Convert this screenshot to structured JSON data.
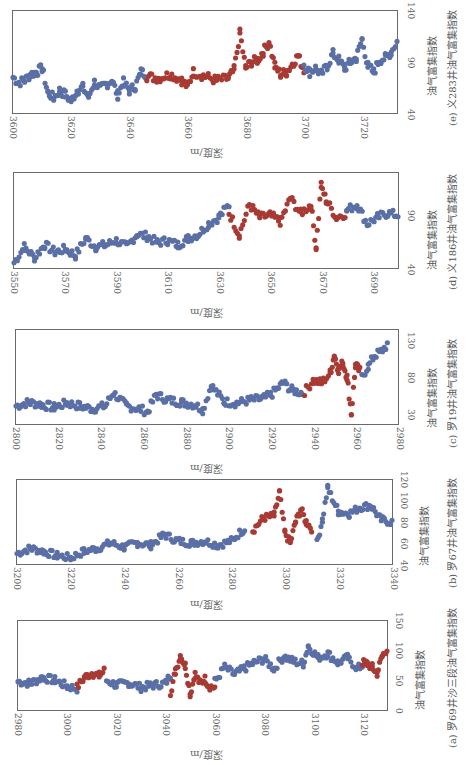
{
  "colors": {
    "normal": "#5a6fa6",
    "enriched": "#a83a33",
    "frame": "#6a6a6a"
  },
  "chart_data": [
    {
      "id": "e",
      "type": "scatter",
      "title": "(e) 义283井油气富集指数",
      "xlabel": "深度/m",
      "ylabel": "油气富集指数",
      "xlim": [
        3600,
        3732
      ],
      "ylim": [
        40,
        140
      ],
      "xticks": [
        "3600",
        "3620",
        "3640",
        "3660",
        "3680",
        "3700",
        "3720"
      ],
      "yticks": [
        "40",
        "90",
        "140"
      ],
      "enriched_interval": [
        3646,
        3700
      ],
      "series": [
        {
          "name": "normal",
          "x": [
            3600,
            3602,
            3604,
            3606,
            3608,
            3610,
            3612,
            3614,
            3616,
            3618,
            3620,
            3622,
            3624,
            3626,
            3628,
            3630,
            3632,
            3634,
            3636,
            3638,
            3640,
            3642,
            3644,
            3646
          ],
          "y": [
            75,
            70,
            72,
            78,
            80,
            84,
            60,
            55,
            62,
            58,
            52,
            62,
            65,
            56,
            70,
            64,
            68,
            72,
            58,
            70,
            62,
            66,
            80,
            78
          ]
        },
        {
          "name": "enriched",
          "x": [
            3646,
            3650,
            3654,
            3658,
            3660,
            3662,
            3666,
            3670,
            3674,
            3676,
            3678,
            3680,
            3682,
            3684,
            3686,
            3688,
            3690,
            3692,
            3694,
            3696,
            3698,
            3700
          ],
          "y": [
            76,
            74,
            78,
            72,
            66,
            80,
            76,
            72,
            74,
            82,
            118,
            84,
            90,
            92,
            100,
            110,
            86,
            78,
            80,
            88,
            96,
            82
          ]
        },
        {
          "name": "normal",
          "x": [
            3700,
            3702,
            3704,
            3706,
            3708,
            3710,
            3712,
            3714,
            3716,
            3718,
            3720,
            3722,
            3724,
            3726,
            3728,
            3730,
            3732
          ],
          "y": [
            88,
            80,
            84,
            78,
            86,
            98,
            92,
            84,
            90,
            94,
            112,
            86,
            80,
            92,
            94,
            100,
            110
          ]
        }
      ]
    },
    {
      "id": "d",
      "type": "scatter",
      "title": "(d) 义186井油气富集指数",
      "xlabel": "深度/m",
      "ylabel": "油气富集指数",
      "xlim": [
        3550,
        3700
      ],
      "ylim": [
        40,
        130
      ],
      "xticks": [
        "3550",
        "3570",
        "3590",
        "3610",
        "3630",
        "3650",
        "3670",
        "3690"
      ],
      "yticks": [
        "40",
        "90"
      ],
      "enriched_interval": [
        3634,
        3681
      ],
      "series": [
        {
          "name": "normal",
          "x": [
            3550,
            3554,
            3558,
            3562,
            3566,
            3570,
            3574,
            3578,
            3582,
            3586,
            3590,
            3594,
            3598,
            3602,
            3606,
            3610,
            3614,
            3618,
            3622,
            3626,
            3630,
            3634
          ],
          "y": [
            45,
            60,
            50,
            62,
            55,
            58,
            52,
            68,
            60,
            62,
            66,
            60,
            72,
            70,
            64,
            66,
            62,
            68,
            72,
            82,
            88,
            100
          ]
        },
        {
          "name": "enriched",
          "x": [
            3634,
            3638,
            3642,
            3646,
            3650,
            3654,
            3658,
            3662,
            3666,
            3668,
            3670,
            3672,
            3676,
            3680
          ],
          "y": [
            92,
            72,
            100,
            88,
            90,
            84,
            106,
            92,
            100,
            60,
            118,
            104,
            88,
            92
          ]
        },
        {
          "name": "normal",
          "x": [
            3680,
            3684,
            3688,
            3692,
            3696,
            3700
          ],
          "y": [
            95,
            100,
            82,
            88,
            92,
            90
          ]
        }
      ]
    },
    {
      "id": "c",
      "type": "scatter",
      "title": "(c) 罗19井油气富集指数",
      "xlabel": "深度/m",
      "ylabel": "油气富集指数",
      "xlim": [
        2800,
        2980
      ],
      "ylim": [
        15,
        145
      ],
      "xticks": [
        "2800",
        "2820",
        "2840",
        "2860",
        "2880",
        "2900",
        "2920",
        "2940",
        "2960",
        "2980"
      ],
      "yticks": [
        "30",
        "80",
        "130"
      ],
      "enriched_interval": [
        2935,
        2963
      ],
      "series": [
        {
          "name": "normal",
          "x": [
            2800,
            2806,
            2812,
            2818,
            2824,
            2830,
            2836,
            2842,
            2846,
            2852,
            2858,
            2862,
            2866,
            2872,
            2878,
            2884,
            2888,
            2892,
            2898,
            2904,
            2910,
            2916,
            2920,
            2926,
            2930,
            2935
          ],
          "y": [
            40,
            45,
            42,
            38,
            44,
            40,
            36,
            40,
            58,
            40,
            36,
            32,
            55,
            48,
            45,
            42,
            35,
            68,
            46,
            44,
            48,
            50,
            55,
            72,
            62,
            58
          ]
        },
        {
          "name": "enriched",
          "x": [
            2936,
            2940,
            2944,
            2948,
            2950,
            2952,
            2954,
            2956,
            2958,
            2960,
            2962
          ],
          "y": [
            60,
            75,
            72,
            85,
            110,
            90,
            100,
            80,
            30,
            96,
            88
          ]
        },
        {
          "name": "normal",
          "x": [
            2963,
            2966,
            2969,
            2972,
            2975
          ],
          "y": [
            80,
            95,
            110,
            115,
            125
          ]
        }
      ]
    },
    {
      "id": "b",
      "type": "scatter",
      "title": "(b) 罗67井油气富集指数",
      "xlabel": "深度/m",
      "ylabel": "油气富集指数",
      "xlim": [
        3200,
        3340
      ],
      "ylim": [
        40,
        120
      ],
      "xticks": [
        "3200",
        "3220",
        "3240",
        "3260",
        "3280",
        "3300",
        "3320",
        "3340"
      ],
      "yticks": [
        "40",
        "60",
        "80",
        "100",
        "120"
      ],
      "enriched_interval": [
        3287,
        3312
      ],
      "series": [
        {
          "name": "normal",
          "x": [
            3200,
            3205,
            3210,
            3215,
            3220,
            3225,
            3230,
            3235,
            3240,
            3245,
            3250,
            3255,
            3260,
            3265,
            3270,
            3275,
            3280,
            3285
          ],
          "y": [
            50,
            55,
            52,
            48,
            46,
            52,
            55,
            60,
            56,
            60,
            58,
            68,
            62,
            60,
            62,
            58,
            62,
            74
          ]
        },
        {
          "name": "enriched",
          "x": [
            3288,
            3292,
            3296,
            3298,
            3300,
            3302,
            3304,
            3306,
            3308,
            3310
          ],
          "y": [
            72,
            84,
            86,
            108,
            70,
            60,
            80,
            92,
            80,
            74
          ]
        },
        {
          "name": "normal",
          "x": [
            3312,
            3314,
            3316,
            3320,
            3324,
            3328,
            3332,
            3336,
            3340
          ],
          "y": [
            60,
            82,
            112,
            90,
            88,
            94,
            96,
            82,
            80
          ]
        }
      ]
    },
    {
      "id": "a",
      "type": "scatter",
      "title": "(a) 罗69井沙三段油气富集指数",
      "xlabel": "深度/m",
      "ylabel": "油气富集指数",
      "xlim": [
        2980,
        3130
      ],
      "ylim": [
        0,
        150
      ],
      "xticks": [
        "2980",
        "3000",
        "3020",
        "3040",
        "3060",
        "3080",
        "3100",
        "3120"
      ],
      "yticks": [
        "0",
        "50",
        "100",
        "150"
      ],
      "enriched_intervals": [
        [
          3004,
          3015
        ],
        [
          3042,
          3060
        ],
        [
          3120,
          3130
        ]
      ],
      "series": [
        {
          "name": "normal",
          "x": [
            2980,
            2985,
            2990,
            2995,
            3000,
            3004
          ],
          "y": [
            48,
            45,
            55,
            50,
            40,
            36
          ]
        },
        {
          "name": "enriched",
          "x": [
            3004,
            3007,
            3010,
            3013,
            3015
          ],
          "y": [
            38,
            55,
            62,
            58,
            66
          ]
        },
        {
          "name": "normal",
          "x": [
            3016,
            3020,
            3025,
            3030,
            3035,
            3040,
            3042
          ],
          "y": [
            50,
            42,
            46,
            38,
            42,
            45,
            60
          ]
        },
        {
          "name": "enriched",
          "x": [
            3042,
            3044,
            3046,
            3048,
            3050,
            3052,
            3054,
            3056,
            3058,
            3060
          ],
          "y": [
            30,
            65,
            92,
            75,
            28,
            60,
            45,
            52,
            40,
            38
          ]
        },
        {
          "name": "normal",
          "x": [
            3060,
            3064,
            3068,
            3072,
            3076,
            3080,
            3084,
            3088,
            3092,
            3096,
            3098,
            3102,
            3106,
            3110,
            3114,
            3118,
            3120
          ],
          "y": [
            48,
            72,
            60,
            70,
            80,
            86,
            70,
            90,
            82,
            78,
            108,
            88,
            95,
            80,
            88,
            70,
            75
          ]
        },
        {
          "name": "enriched",
          "x": [
            3120,
            3122,
            3124,
            3126,
            3128,
            3130
          ],
          "y": [
            80,
            78,
            72,
            62,
            90,
            104
          ]
        }
      ]
    }
  ]
}
